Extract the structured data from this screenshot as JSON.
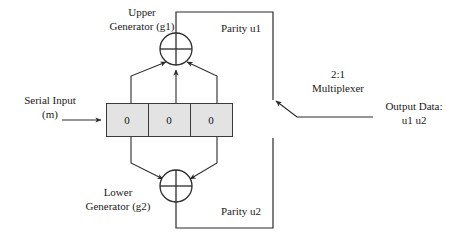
{
  "diagram": {
    "colors": {
      "line": "#2b2b2b",
      "register_fill": "#e3e3e3",
      "register_border": "#3b3b3b",
      "text": "#1a1a1a",
      "background": "#ffffff"
    },
    "labels": {
      "upper_generator": "Upper\nGenerator (g1)",
      "upper_generator_line1": "Upper",
      "upper_generator_line2": "Generator (g1)",
      "lower_generator_line1": "Lower",
      "lower_generator_line2": "Generator (g2)",
      "serial_input_line1": "Serial Input",
      "serial_input_line2": "(m)",
      "parity_u1": "Parity u1",
      "parity_u2": "Parity u2",
      "multiplexer_line1": "2:1",
      "multiplexer_line2": "Multiplexer",
      "output_data_line1": "Output Data:",
      "output_data_line2": "u1 u2"
    },
    "shift_register": {
      "cells": [
        {
          "value": "0"
        },
        {
          "value": "0"
        },
        {
          "value": "0"
        }
      ]
    },
    "gates": [
      {
        "name": "upper-xor",
        "symbol": "xor-plus",
        "label": "Upper Generator (g1)"
      },
      {
        "name": "lower-xor",
        "symbol": "xor-plus",
        "label": "Lower Generator (g2)"
      }
    ]
  }
}
